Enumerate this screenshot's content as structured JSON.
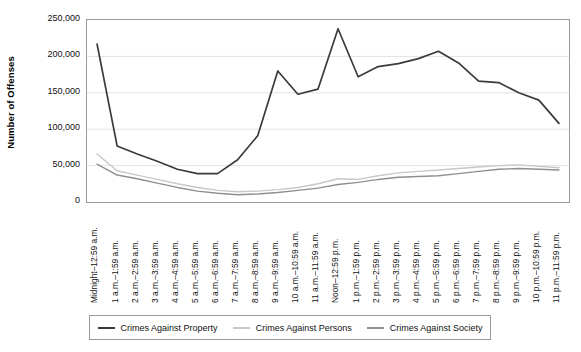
{
  "chart_data": {
    "type": "line",
    "title": "",
    "xlabel": "",
    "ylabel": "Number of Offenses",
    "ylim": [
      0,
      250000
    ],
    "ytick_labels": [
      "250,000",
      "200,000",
      "150,000",
      "100,000",
      "50,000",
      "0"
    ],
    "ytick_values": [
      250000,
      200000,
      150000,
      100000,
      50000,
      0
    ],
    "grid": true,
    "legend_position": "bottom",
    "categories": [
      "Midnight–12:59 a.m.",
      "1 a.m.–1:59 a.m.",
      "2 a.m.–2:59 a.m.",
      "3 a.m.–3:59 a.m.",
      "4 a.m.–4:59 a.m.",
      "5 a.m.–5:59 a.m.",
      "6 a.m.–6:59 a.m.",
      "7 a.m.–7:59 a.m.",
      "8 a.m.–8:59 a.m.",
      "9 a.m.–9:59 a.m.",
      "10 a.m.–10:59 a.m.",
      "11 a.m.–11:59 a.m.",
      "Noon–12:59 p.m.",
      "1 p.m.–1:59 p.m.",
      "2 p.m.–2:59 p.m.",
      "3 p.m.–3:59 p.m.",
      "4 p.m.–4:59 p.m.",
      "5 p.m.–5:59 p.m.",
      "6 p.m.–6:59 p.m.",
      "7 p.m.–7:59 p.m.",
      "8 p.m.–8:59 p.m.",
      "9 p.m.–9:59 p.m.",
      "10 p.m.–10:59 p.m.",
      "11 p.m.–11:59 p.m."
    ],
    "series": [
      {
        "name": "Crimes Against Property",
        "color": "#3b3b3b",
        "values": [
          217000,
          77000,
          66000,
          56000,
          45000,
          39000,
          39000,
          58000,
          91000,
          180000,
          148000,
          155000,
          238000,
          172000,
          186000,
          190000,
          197000,
          207000,
          191000,
          166000,
          164000,
          150000,
          140000,
          108000
        ]
      },
      {
        "name": "Crimes Against Persons",
        "color": "#c8c8c8",
        "values": [
          66000,
          43000,
          37000,
          31000,
          25000,
          20000,
          16000,
          14000,
          15000,
          17000,
          20000,
          25000,
          32000,
          31000,
          36000,
          40000,
          42000,
          44000,
          46000,
          48000,
          50000,
          51000,
          49000,
          47000
        ]
      },
      {
        "name": "Crimes Against Society",
        "color": "#8f8f8f",
        "values": [
          52000,
          37000,
          32000,
          26000,
          20000,
          15000,
          12000,
          10000,
          11000,
          13000,
          16000,
          19000,
          24000,
          27000,
          31000,
          34000,
          35000,
          36000,
          39000,
          42000,
          45000,
          46000,
          45000,
          44000
        ]
      }
    ]
  },
  "legend": {
    "items": [
      {
        "label": "Crimes Against Property",
        "color": "#3b3b3b"
      },
      {
        "label": "Crimes Against Persons",
        "color": "#c8c8c8"
      },
      {
        "label": "Crimes Against Society",
        "color": "#8f8f8f"
      }
    ]
  },
  "axis": {
    "y_title": "Number of Offenses"
  }
}
